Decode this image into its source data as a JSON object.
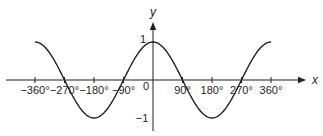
{
  "chart_data": {
    "type": "line",
    "title": "",
    "xlabel": "x",
    "ylabel": "y",
    "function": "y = cos x",
    "xlim": [
      -360,
      360
    ],
    "ylim": [
      -1,
      1
    ],
    "grid": false,
    "x_ticks": [
      -360,
      -270,
      -180,
      -90,
      90,
      180,
      270,
      360
    ],
    "x_tick_labels": [
      "−360°",
      "−270°",
      "−180°",
      "−90°",
      "90°",
      "180°",
      "270°",
      "360°"
    ],
    "y_tick_labels": [
      "1",
      "−1"
    ],
    "origin_label": "0",
    "series": [
      {
        "name": "cos x",
        "x": [
          -360,
          -270,
          -180,
          -90,
          0,
          90,
          180,
          270,
          360
        ],
        "values": [
          1,
          0,
          -1,
          0,
          1,
          0,
          -1,
          0,
          1
        ]
      }
    ]
  },
  "colors": {
    "line": "#231f20",
    "background": "#ffffff"
  }
}
